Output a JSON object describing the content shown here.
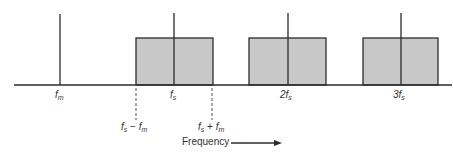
{
  "diagram": {
    "type": "frequency-spectrum",
    "colors": {
      "line": "#2b2b2b",
      "box_fill": "#c8c8c8",
      "box_stroke": "#2b2b2b",
      "dashed": "#555555",
      "text": "#333333"
    },
    "axis": {
      "label": "Frequency"
    },
    "spectral_lines": [
      {
        "id": "fm",
        "label_main": "f",
        "label_sub": "m"
      },
      {
        "id": "fs",
        "label_main": "f",
        "label_sub": "s"
      },
      {
        "id": "2fs",
        "label_main": "2f",
        "label_sub": "s"
      },
      {
        "id": "3fs",
        "label_main": "3f",
        "label_sub": "s"
      }
    ],
    "sidebands": [
      {
        "center": "fs"
      },
      {
        "center": "2fs"
      },
      {
        "center": "3fs"
      }
    ],
    "markers": [
      {
        "id": "fs-minus-fm",
        "left_main": "f",
        "left_sub": "s",
        "op": " − ",
        "right_main": "f",
        "right_sub": "m"
      },
      {
        "id": "fs-plus-fm",
        "left_main": "f",
        "left_sub": "s",
        "op": " + ",
        "right_main": "f",
        "right_sub": "m"
      }
    ]
  }
}
